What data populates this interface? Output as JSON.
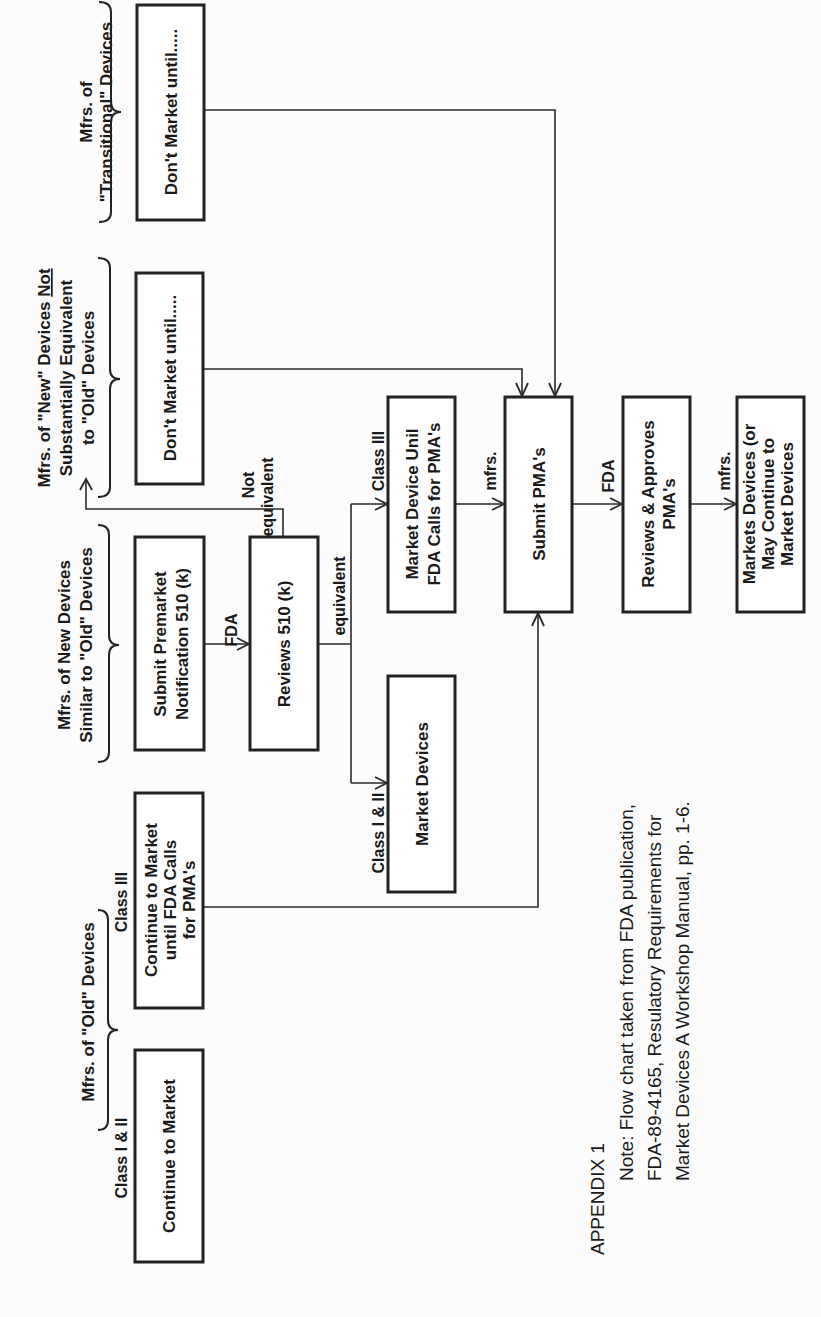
{
  "diagram": {
    "orientation": "rotated 90 degrees counter-clockwise",
    "groups": {
      "transitional": {
        "line1": "Mfrs. of",
        "line2": "\"Transitional\" Devices"
      },
      "new_not_equivalent": {
        "line1": "Mfrs. of \"New\" Devices Not",
        "line1_underlined_word": "Not",
        "line2": "Substantially Equivalent",
        "line3": "to \"Old\" Devices"
      },
      "new_similar": {
        "line1": "Mfrs. of New Devices",
        "line2": "Similar to \"Old\" Devices"
      },
      "old": {
        "line1": "Mfrs. of  \"Old\" Devices",
        "class_i_ii": "Class I & II",
        "class_iii": "Class III"
      }
    },
    "boxes": {
      "dont_market_transitional": [
        "Don't Market until....."
      ],
      "dont_market_new": [
        "Don't Market until....."
      ],
      "submit_premarket": [
        "Submit Premarket",
        "Notification 510 (k)"
      ],
      "reviews_510k": [
        "Reviews 510 (k)"
      ],
      "market_device_until": [
        "Market Device Unil",
        "FDA Calls for PMA's"
      ],
      "submit_pma": [
        "Submit PMA's"
      ],
      "reviews_approves": [
        "Reviews & Approves",
        "PMA's"
      ],
      "markets_devices": [
        "Markets Devices (or",
        "May Continue to",
        "Market Devices"
      ],
      "market_devices": [
        "Market Devices"
      ],
      "continue_until_fda": [
        "Continue to Market",
        "until FDA Calls",
        "for PMA's"
      ],
      "continue_to_market": [
        "Continue to Market"
      ]
    },
    "edge_labels": {
      "fda_1": "FDA",
      "not_equivalent_1": "Not",
      "not_equivalent_2": "equivalent",
      "equivalent": "equivalent",
      "class_iii": "Class III",
      "class_i_ii": "Class I & II",
      "mfrs_1": "mfrs.",
      "fda_2": "FDA",
      "mfrs_2": "mfrs."
    },
    "edges": [
      {
        "from": "submit_premarket",
        "to": "reviews_510k",
        "label": "FDA"
      },
      {
        "from": "reviews_510k",
        "to": "new_not_equivalent",
        "label": "Not equivalent"
      },
      {
        "from": "reviews_510k",
        "to": "market_device_until",
        "label": "equivalent / Class III"
      },
      {
        "from": "reviews_510k",
        "to": "market_devices",
        "label": "equivalent / Class I & II"
      },
      {
        "from": "market_device_until",
        "to": "submit_pma",
        "label": "mfrs."
      },
      {
        "from": "dont_market_new",
        "to": "submit_pma",
        "label": ""
      },
      {
        "from": "dont_market_transitional",
        "to": "submit_pma",
        "label": ""
      },
      {
        "from": "continue_until_fda",
        "to": "submit_pma",
        "label": ""
      },
      {
        "from": "submit_pma",
        "to": "reviews_approves",
        "label": "FDA"
      },
      {
        "from": "reviews_approves",
        "to": "markets_devices",
        "label": "mfrs."
      }
    ]
  },
  "footer": {
    "appendix": "APPENDIX 1",
    "note_line1": "Note:  Flow chart taken from FDA publication,",
    "note_line2": "FDA-89-4165, Resulatory Requirements for",
    "note_line3": "Market Devices A Workshop Manual, pp. 1-6."
  }
}
